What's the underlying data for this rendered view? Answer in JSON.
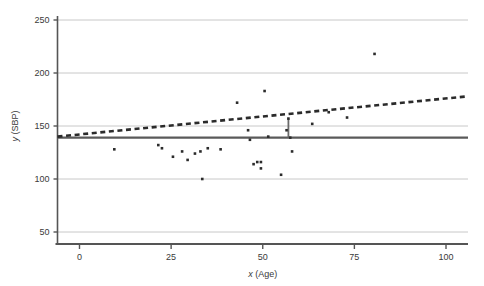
{
  "chart_data": {
    "type": "scatter",
    "title": "",
    "xlabel": "x (Age)",
    "ylabel": "y (SBP)",
    "xlim": [
      -6,
      106
    ],
    "ylim": [
      50,
      250
    ],
    "xticks": [
      0,
      25,
      50,
      75,
      100
    ],
    "yticks": [
      50,
      100,
      150,
      200,
      250
    ],
    "xtick_labels": [
      "0",
      "25",
      "50",
      "75",
      "100"
    ],
    "ytick_labels": [
      "50",
      "100",
      "150",
      "200",
      "250"
    ],
    "grid": "horizontal",
    "legend": "none",
    "point_color": "#2b2b2b",
    "point_marker": "square",
    "point_size": 2.6,
    "points": [
      {
        "x": 9.5,
        "y": 128
      },
      {
        "x": 21.5,
        "y": 132
      },
      {
        "x": 22.5,
        "y": 129
      },
      {
        "x": 25.5,
        "y": 121
      },
      {
        "x": 28.0,
        "y": 126
      },
      {
        "x": 29.5,
        "y": 118
      },
      {
        "x": 31.5,
        "y": 124
      },
      {
        "x": 33.0,
        "y": 126
      },
      {
        "x": 33.5,
        "y": 100
      },
      {
        "x": 35.0,
        "y": 129
      },
      {
        "x": 38.5,
        "y": 128
      },
      {
        "x": 43.0,
        "y": 172
      },
      {
        "x": 46.0,
        "y": 146
      },
      {
        "x": 46.5,
        "y": 137
      },
      {
        "x": 47.5,
        "y": 114
      },
      {
        "x": 48.5,
        "y": 116
      },
      {
        "x": 49.5,
        "y": 110
      },
      {
        "x": 49.5,
        "y": 116
      },
      {
        "x": 50.5,
        "y": 183
      },
      {
        "x": 51.5,
        "y": 140
      },
      {
        "x": 55.0,
        "y": 104
      },
      {
        "x": 56.5,
        "y": 146
      },
      {
        "x": 57.0,
        "y": 157
      },
      {
        "x": 57.5,
        "y": 139
      },
      {
        "x": 58.0,
        "y": 126
      },
      {
        "x": 63.5,
        "y": 152
      },
      {
        "x": 68.0,
        "y": 163
      },
      {
        "x": 73.0,
        "y": 158
      },
      {
        "x": 80.5,
        "y": 218
      }
    ],
    "lines": [
      {
        "name": "mean-line",
        "style": "solid",
        "color": "#5a5a5a",
        "width": 2.2,
        "x1": -6,
        "y1": 139,
        "x2": 106,
        "y2": 139
      },
      {
        "name": "regression-line",
        "style": "dashed",
        "color": "#2b2b2b",
        "width": 2.6,
        "x1": -6,
        "y1": 140,
        "x2": 106,
        "y2": 178
      }
    ],
    "segments": [
      {
        "name": "residual-segment",
        "color": "#6a6a6a",
        "width": 1.8,
        "x": 57.0,
        "y1": 139,
        "y2": 157
      }
    ]
  },
  "axes": {
    "y_axis_label": "y (SBP)",
    "y_axis_label_italic": "y",
    "y_axis_label_rest": " (SBP)",
    "x_axis_label": "x (Age)",
    "x_axis_label_italic": "x",
    "x_axis_label_rest": " (Age)",
    "axis_color": "#555555",
    "grid_color": "#c8c8c8"
  }
}
